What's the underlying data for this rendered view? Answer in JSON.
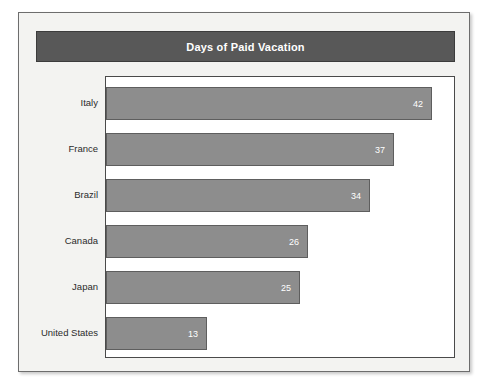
{
  "chart_data": {
    "type": "bar",
    "orientation": "horizontal",
    "title": "Days of Paid Vacation",
    "xlabel": "",
    "ylabel": "",
    "categories": [
      "Italy",
      "France",
      "Brazil",
      "Canada",
      "Japan",
      "United States"
    ],
    "values": [
      42,
      37,
      34,
      26,
      25,
      13
    ],
    "value_labels": [
      "42",
      "37",
      "34",
      "26",
      "25",
      "13"
    ],
    "xlim": [
      0,
      44
    ],
    "grid": false,
    "legend": null,
    "series": [
      {
        "name": "Days of Paid Vacation",
        "values": [
          42,
          37,
          34,
          26,
          25,
          13
        ]
      }
    ]
  },
  "colors": {
    "bar_fill": "#8d8d8d",
    "bar_stroke": "#5e5e5e",
    "title_band": "#585858",
    "title_text": "#ffffff",
    "plot_background": "#ffffff",
    "panel_background": "#f3f3f1",
    "frame_stroke": "#6d6d6d",
    "label_text": "#2b2b2b"
  }
}
